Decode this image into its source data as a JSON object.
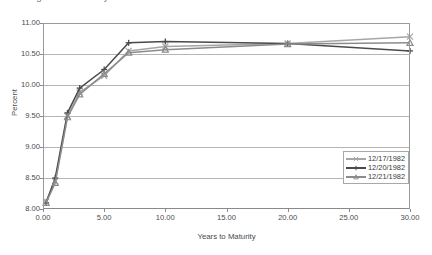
{
  "chart_data": {
    "type": "line",
    "title": "Figure 1. Treasury Yield Curves",
    "xlabel": "Years to Maturity",
    "ylabel": "Percent",
    "xlim": [
      0.0,
      30.0
    ],
    "ylim": [
      8.0,
      11.0
    ],
    "xticks": [
      "0.00",
      "5.00",
      "10.00",
      "15.00",
      "20.00",
      "25.00",
      "30.00"
    ],
    "xtick_values": [
      0,
      5,
      10,
      15,
      20,
      25,
      30
    ],
    "yticks": [
      "8.00",
      "8.50",
      "9.00",
      "9.50",
      "10.00",
      "10.50",
      "11.00"
    ],
    "ytick_values": [
      8.0,
      8.5,
      9.0,
      9.5,
      10.0,
      10.5,
      11.0
    ],
    "grid": "horizontal",
    "legend_position": "lower-right",
    "series": [
      {
        "name": "12/17/1982",
        "color": "#a6a6a6",
        "marker": "x",
        "x": [
          0.25,
          1,
          2,
          3,
          5,
          7,
          10,
          20,
          30
        ],
        "values": [
          8.12,
          8.45,
          9.5,
          9.88,
          10.15,
          10.55,
          10.62,
          10.67,
          10.78
        ]
      },
      {
        "name": "12/20/1982",
        "color": "#4a4a4a",
        "marker": "plus",
        "x": [
          0.25,
          1,
          2,
          3,
          5,
          7,
          10,
          20,
          30
        ],
        "values": [
          8.1,
          8.5,
          9.55,
          9.95,
          10.25,
          10.68,
          10.7,
          10.67,
          10.55
        ]
      },
      {
        "name": "12/21/1982",
        "color": "#8c8c8c",
        "marker": "triangle",
        "x": [
          0.25,
          1,
          2,
          3,
          5,
          7,
          10,
          20,
          30
        ],
        "values": [
          8.1,
          8.42,
          9.48,
          9.85,
          10.18,
          10.52,
          10.57,
          10.66,
          10.68
        ]
      }
    ]
  }
}
